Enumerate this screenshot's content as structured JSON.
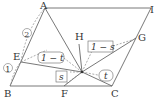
{
  "diagram": {
    "type": "geometry",
    "points": {
      "A": {
        "label": "A",
        "x": 45,
        "y": 8
      },
      "I": {
        "label": "I",
        "x": 151,
        "y": 8
      },
      "B": {
        "label": "B",
        "x": 10,
        "y": 86
      },
      "C": {
        "label": "C",
        "x": 112,
        "y": 86
      },
      "F": {
        "label": "F",
        "x": 64,
        "y": 86
      },
      "E": {
        "label": "E",
        "x": 21,
        "y": 62
      },
      "G": {
        "label": "G",
        "x": 136,
        "y": 38
      },
      "H": {
        "label": "H",
        "x": 79,
        "y": 38
      },
      "P": {
        "label": "",
        "x": 82,
        "y": 72
      }
    },
    "labels": {
      "A": "A",
      "I": "I",
      "B": "B",
      "C": "C",
      "F": "F",
      "E": "E",
      "G": "G",
      "H": "H",
      "circle1": "1",
      "circle2": "2",
      "box_1_minus_t": "1 − t",
      "box_1_minus_s": "1 − s",
      "box_s": "s",
      "box_t": "t"
    },
    "colors": {
      "line": "#555555",
      "dashed": "#888888",
      "text": "#333333"
    }
  }
}
